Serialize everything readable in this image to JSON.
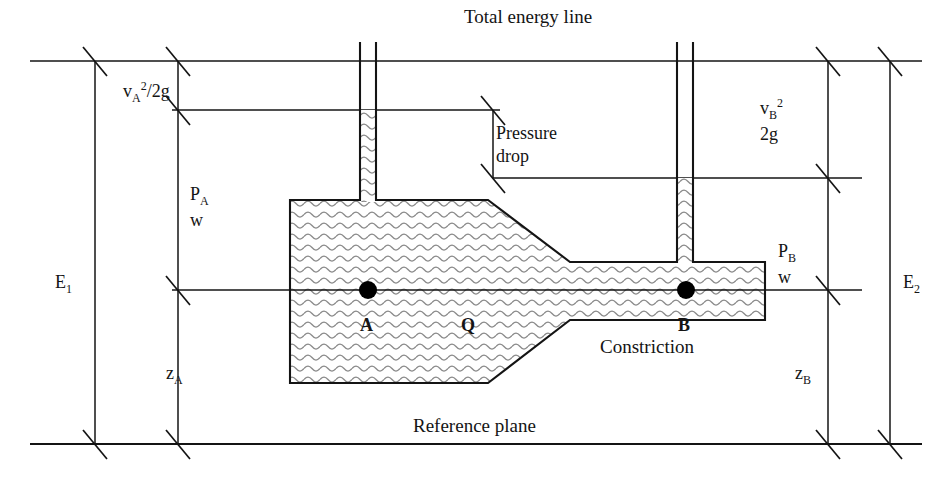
{
  "figure": {
    "title_text": "Total energy line",
    "reference_plane_text": "Reference plane",
    "constriction_text": "Constriction",
    "pressure_drop_line1": "Pressure",
    "pressure_drop_line2": "drop",
    "point_a_label": "A",
    "point_b_label": "B",
    "flow_label": "Q"
  },
  "heads": {
    "velocity_head_a": "v",
    "velocity_head_a_sub": "A",
    "velocity_head_a_sup": "2",
    "velocity_head_a_tail": "/2g",
    "velocity_head_b_line1_base": "v",
    "velocity_head_b_line1_sub": "B",
    "velocity_head_b_line1_sup": "2",
    "velocity_head_b_line2": "2g",
    "pressure_head_a_line1_base": "P",
    "pressure_head_a_line1_sub": "A",
    "pressure_head_a_line2": "w",
    "pressure_head_b_line1_base": "P",
    "pressure_head_b_line1_sub": "B",
    "pressure_head_b_line2": "w",
    "elevation_a_base": "z",
    "elevation_a_sub": "A",
    "elevation_b_base": "z",
    "elevation_b_sub": "B",
    "total_energy_1_base": "E",
    "total_energy_1_sub": "1",
    "total_energy_2_base": "E",
    "total_energy_2_sub": "2"
  },
  "colors": {
    "stroke": "#141414",
    "text": "#141414",
    "fluid_hatch": "#8a8a8a",
    "background": "#ffffff",
    "point_marker": "#000000"
  },
  "geometry": {
    "total_energy_line_y": 61,
    "hgl_a_y": 110,
    "hgl_b_y": 178,
    "centerline_y": 290,
    "reference_plane_y": 444,
    "dim_e1_x": 95,
    "dim_a_x": 178,
    "dim_b_x": 828,
    "dim_e2_x": 890,
    "pipe_left_x": 290,
    "pipe_top_y": 200,
    "pipe_bottom_y": 383,
    "taper_start_x": 488,
    "narrow_start_x": 570,
    "narrow_top_y": 262,
    "narrow_bottom_y": 320,
    "narrow_end_x": 765,
    "tube_a_left_x": 360,
    "tube_a_right_x": 376,
    "tube_b_left_x": 677,
    "tube_b_right_x": 693,
    "tube_top_y": 42
  }
}
